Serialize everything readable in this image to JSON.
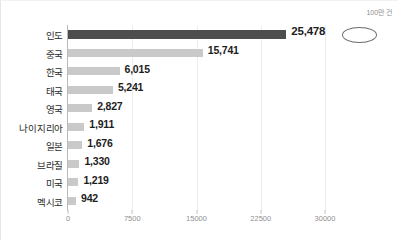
{
  "unit_caption": "100만 건",
  "chart_data": {
    "type": "bar",
    "orientation": "horizontal",
    "title": "",
    "subtitle": "",
    "xlabel": "",
    "ylabel": "",
    "unit_label": "100만 건",
    "xlim": [
      0,
      30000
    ],
    "xticks": [
      0,
      7500,
      15000,
      22500,
      30000
    ],
    "xtick_labels": [
      "0",
      "7500",
      "15000",
      "22500",
      "30000"
    ],
    "grid": true,
    "grid_axis": "x",
    "legend": false,
    "highlight_category": "인도",
    "colors": {
      "bar": "#c9c9c9",
      "bar_highlight": "#4d4d4d",
      "value_text": "#1d1d1d",
      "category_text": "#2b2b2b",
      "tick_text": "#8f8f8f",
      "gridline": "#ededed",
      "axis_line": "#b9b9b9",
      "background": "#ffffff"
    },
    "categories": [
      "인도",
      "중국",
      "한국",
      "태국",
      "영국",
      "나이지리아",
      "일본",
      "브라질",
      "미국",
      "멕시코"
    ],
    "values": [
      25478,
      15741,
      6015,
      5241,
      2827,
      1911,
      1676,
      1330,
      1219,
      942
    ],
    "value_labels": [
      "25,478",
      "15,741",
      "6,015",
      "5,241",
      "2,827",
      "1,911",
      "1,676",
      "1,330",
      "1,219",
      "942"
    ],
    "bars": [
      {
        "category": "인도",
        "value": 25478,
        "label": "25,478",
        "highlight": true
      },
      {
        "category": "중국",
        "value": 15741,
        "label": "15,741",
        "highlight": false
      },
      {
        "category": "한국",
        "value": 6015,
        "label": "6,015",
        "highlight": false
      },
      {
        "category": "태국",
        "value": 5241,
        "label": "5,241",
        "highlight": false
      },
      {
        "category": "영국",
        "value": 2827,
        "label": "2,827",
        "highlight": false
      },
      {
        "category": "나이지리아",
        "value": 1911,
        "label": "1,911",
        "highlight": false
      },
      {
        "category": "일본",
        "value": 1676,
        "label": "1,676",
        "highlight": false
      },
      {
        "category": "브라질",
        "value": 1330,
        "label": "1,330",
        "highlight": false
      },
      {
        "category": "미국",
        "value": 1219,
        "label": "1,219",
        "highlight": false
      },
      {
        "category": "멕시코",
        "value": 942,
        "label": "942",
        "highlight": false
      }
    ]
  }
}
